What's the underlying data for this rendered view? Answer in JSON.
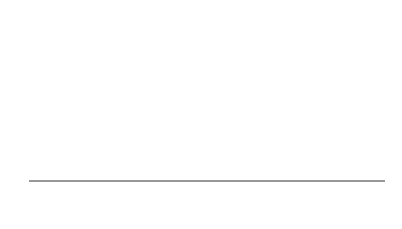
{
  "title": {
    "text": "The populations under H",
    "subscript": "a"
  },
  "axis": {
    "label": "x"
  },
  "means": [
    {
      "symbol": "μ",
      "subscript": "1",
      "x": 130
    },
    {
      "symbol": "μ",
      "subscript": "2",
      "x": 158
    },
    {
      "symbol": "μ",
      "subscript": "3",
      "x": 264
    }
  ],
  "colors": {
    "curve": "#9a9a9a",
    "axis": "#333333"
  }
}
